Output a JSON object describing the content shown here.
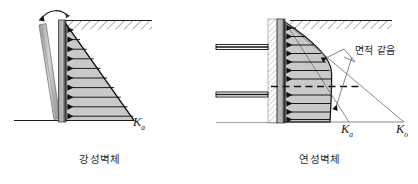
{
  "figure": {
    "panels": [
      {
        "id": "rigid-wall",
        "caption": "강성벽체",
        "pressure_label": "K",
        "pressure_label_sub": "a",
        "pressure_shape": "triangular",
        "arrow_count": 10,
        "rotation_arrow": "wall rotation about base"
      },
      {
        "id": "flexible-wall",
        "caption": "연성벽체",
        "pressure_shape": "bulging",
        "arrow_count": 11,
        "strut_count": 2,
        "annotation": "면적 같음",
        "labels": [
          {
            "base": "K",
            "sub": "a"
          },
          {
            "base": "K",
            "sub": "o"
          }
        ]
      }
    ]
  },
  "colors": {
    "fill_gray": "#c9c9c9",
    "wall_dark": "#555555",
    "line": "#1a1a1a",
    "hatch": "#4a4a4a",
    "leader": "#6b6b6b"
  }
}
